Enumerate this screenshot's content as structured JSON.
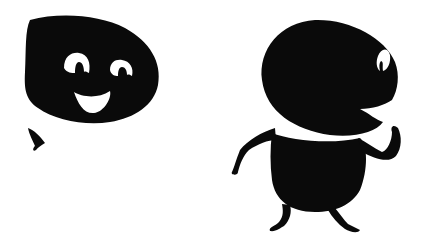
{
  "figures": [
    {
      "name": "smiling-blob-head",
      "description": "Black rounded head with two arched white eyes and a wide white smile"
    },
    {
      "name": "walking-blob-creature",
      "description": "Black round-headed creature with open mouth, white neck band, arms and legs"
    }
  ],
  "colors": {
    "background": "#ffffff",
    "ink": "#0a0a0a"
  }
}
